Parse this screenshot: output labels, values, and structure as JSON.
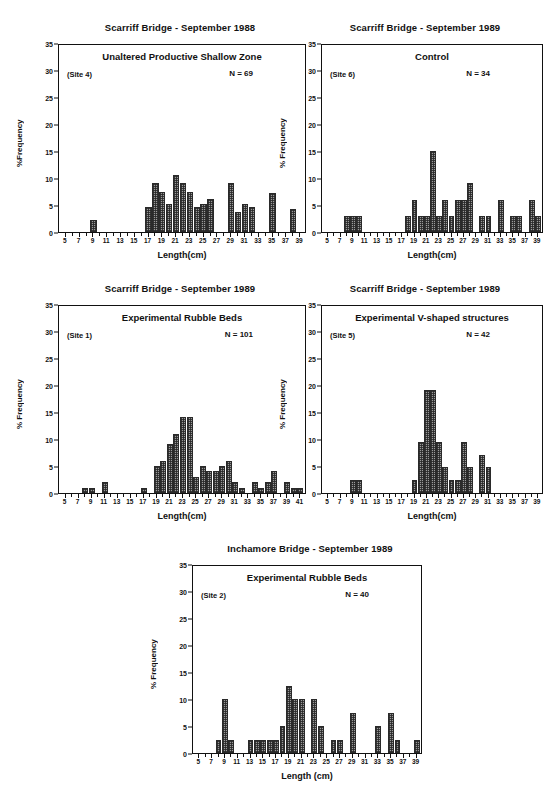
{
  "figure": {
    "bar_color": "#9a9a9a",
    "axis_color": "#111111"
  },
  "panels": [
    {
      "id": "panel-site4",
      "title": "Scarriff Bridge - September 1988",
      "heading": "Unaltered Productive Shallow Zone",
      "site": "(Site 4)",
      "n_label": "N = 69",
      "xlabel": "Length(cm)",
      "ylabel": "%Frequency",
      "chart_data": {
        "type": "bar",
        "title": "Scarriff Bridge - September 1988",
        "xlabel": "Length(cm)",
        "ylabel": "%Frequency",
        "ylim": [
          0,
          35
        ],
        "yticks": [
          0,
          5,
          10,
          15,
          20,
          25,
          30,
          35
        ],
        "xlim": [
          4,
          40
        ],
        "xticks": [
          5,
          7,
          9,
          11,
          13,
          15,
          17,
          19,
          21,
          23,
          25,
          27,
          29,
          31,
          33,
          35,
          37,
          39
        ],
        "grid": false,
        "categories": [
          5,
          6,
          7,
          8,
          9,
          10,
          11,
          12,
          13,
          14,
          15,
          16,
          17,
          18,
          19,
          20,
          21,
          22,
          23,
          24,
          25,
          26,
          27,
          28,
          29,
          30,
          31,
          32,
          33,
          34,
          35,
          36,
          37,
          38,
          39
        ],
        "values": [
          0,
          0,
          0,
          0,
          2.2,
          0,
          0,
          0,
          0,
          0,
          0,
          0,
          4.6,
          9.1,
          7.5,
          5.1,
          10.5,
          9.0,
          7.5,
          4.6,
          5.1,
          6.1,
          0,
          0,
          9.1,
          3.7,
          5.2,
          4.7,
          0,
          0,
          7.2,
          0,
          0,
          4.3,
          0
        ]
      }
    },
    {
      "id": "panel-site6",
      "title": "Scarriff Bridge - September 1989",
      "heading": "Control",
      "site": "(Site 6)",
      "n_label": "N = 34",
      "xlabel": "Length(cm)",
      "ylabel": "% Frequency",
      "chart_data": {
        "type": "bar",
        "title": "Scarriff Bridge - September 1989",
        "xlabel": "Length(cm)",
        "ylabel": "% Frequency",
        "ylim": [
          0,
          35
        ],
        "yticks": [
          0,
          5,
          10,
          15,
          20,
          25,
          30,
          35
        ],
        "xlim": [
          4,
          40
        ],
        "xticks": [
          5,
          7,
          9,
          11,
          13,
          15,
          17,
          19,
          21,
          23,
          25,
          27,
          29,
          31,
          33,
          35,
          37,
          39
        ],
        "grid": false,
        "categories": [
          5,
          6,
          7,
          8,
          9,
          10,
          11,
          12,
          13,
          14,
          15,
          16,
          17,
          18,
          19,
          20,
          21,
          22,
          23,
          24,
          25,
          26,
          27,
          28,
          29,
          30,
          31,
          32,
          33,
          34,
          35,
          36,
          37,
          38,
          39
        ],
        "values": [
          0,
          0,
          0,
          3,
          3,
          3,
          0,
          0,
          0,
          0,
          0,
          0,
          0,
          3,
          6,
          3,
          3,
          15,
          3,
          6,
          3,
          6,
          6,
          9,
          0,
          3,
          3,
          0,
          6,
          0,
          3,
          3,
          0,
          6,
          3
        ]
      }
    },
    {
      "id": "panel-site1",
      "title": "Scarriff Bridge - September 1989",
      "heading": "Experimental Rubble Beds",
      "site": "(Site 1)",
      "n_label": "N = 101",
      "xlabel": "Length(cm)",
      "ylabel": "% Frequency",
      "chart_data": {
        "type": "bar",
        "title": "Scarriff Bridge - September 1989",
        "xlabel": "Length(cm)",
        "ylabel": "% Frequency",
        "ylim": [
          0,
          35
        ],
        "yticks": [
          0,
          5,
          10,
          15,
          20,
          25,
          30,
          35
        ],
        "xlim": [
          4,
          42
        ],
        "xticks": [
          5,
          7,
          9,
          11,
          13,
          15,
          17,
          19,
          21,
          23,
          25,
          27,
          29,
          31,
          33,
          35,
          37,
          39,
          41
        ],
        "grid": false,
        "categories": [
          5,
          6,
          7,
          8,
          9,
          10,
          11,
          12,
          13,
          14,
          15,
          16,
          17,
          18,
          19,
          20,
          21,
          22,
          23,
          24,
          25,
          26,
          27,
          28,
          29,
          30,
          31,
          32,
          33,
          34,
          35,
          36,
          37,
          38,
          39,
          40,
          41
        ],
        "values": [
          0,
          0,
          0,
          1,
          1,
          0,
          2,
          0,
          0,
          0,
          0,
          0,
          1,
          0,
          5,
          6,
          9,
          11,
          14,
          14,
          3,
          5,
          4,
          4,
          5,
          6,
          2,
          1,
          0,
          2,
          1,
          2,
          4,
          0,
          2,
          1,
          1
        ]
      }
    },
    {
      "id": "panel-site5",
      "title": "Scarriff Bridge - September 1989",
      "heading": "Experimental V-shaped structures",
      "site": "(Site 5)",
      "n_label": "N = 42",
      "xlabel": "Length(cm)",
      "ylabel": "% Frequency",
      "chart_data": {
        "type": "bar",
        "title": "Scarriff Bridge - September 1989",
        "xlabel": "Length(cm)",
        "ylabel": "% Frequency",
        "ylim": [
          0,
          35
        ],
        "yticks": [
          0,
          5,
          10,
          15,
          20,
          25,
          30,
          35
        ],
        "xlim": [
          4,
          40
        ],
        "xticks": [
          5,
          7,
          9,
          11,
          13,
          15,
          17,
          19,
          21,
          23,
          25,
          27,
          29,
          31,
          33,
          35,
          37,
          39
        ],
        "grid": false,
        "categories": [
          5,
          6,
          7,
          8,
          9,
          10,
          11,
          12,
          13,
          14,
          15,
          16,
          17,
          18,
          19,
          20,
          21,
          22,
          23,
          24,
          25,
          26,
          27,
          28,
          29,
          30,
          31,
          32,
          33,
          34,
          35,
          36,
          37,
          38,
          39
        ],
        "values": [
          0,
          0,
          0,
          0,
          2.4,
          2.4,
          0,
          0,
          0,
          0,
          0,
          0,
          0,
          0,
          2.4,
          9.5,
          19,
          19,
          9.5,
          4.8,
          2.4,
          2.4,
          9.5,
          4.8,
          0,
          7.1,
          4.8,
          0,
          0,
          0,
          0,
          0,
          0,
          0,
          0
        ]
      }
    },
    {
      "id": "panel-site2",
      "title": "Inchamore Bridge - September 1989",
      "heading": "Experimental Rubble Beds",
      "site": "(Site 2)",
      "n_label": "N = 40",
      "xlabel": "Length (cm)",
      "ylabel": "% Frequency",
      "chart_data": {
        "type": "bar",
        "title": "Inchamore Bridge - September 1989",
        "xlabel": "Length (cm)",
        "ylabel": "% Frequency",
        "ylim": [
          0,
          35
        ],
        "yticks": [
          0,
          5,
          10,
          15,
          20,
          25,
          30,
          35
        ],
        "xlim": [
          4,
          40
        ],
        "xticks": [
          5,
          7,
          9,
          11,
          13,
          15,
          17,
          19,
          21,
          23,
          25,
          27,
          29,
          31,
          33,
          35,
          37,
          39
        ],
        "grid": false,
        "categories": [
          5,
          6,
          7,
          8,
          9,
          10,
          11,
          12,
          13,
          14,
          15,
          16,
          17,
          18,
          19,
          20,
          21,
          22,
          23,
          24,
          25,
          26,
          27,
          28,
          29,
          30,
          31,
          32,
          33,
          34,
          35,
          36,
          37,
          38,
          39
        ],
        "values": [
          0,
          0,
          0,
          2.5,
          10,
          2.5,
          0,
          0,
          2.5,
          2.5,
          2.5,
          2.5,
          2.5,
          5,
          12.5,
          10,
          10,
          0,
          10,
          5,
          0,
          2.5,
          2.5,
          0,
          7.5,
          0,
          0,
          0,
          5,
          0,
          7.5,
          2.5,
          0,
          0,
          2.5
        ]
      }
    }
  ]
}
